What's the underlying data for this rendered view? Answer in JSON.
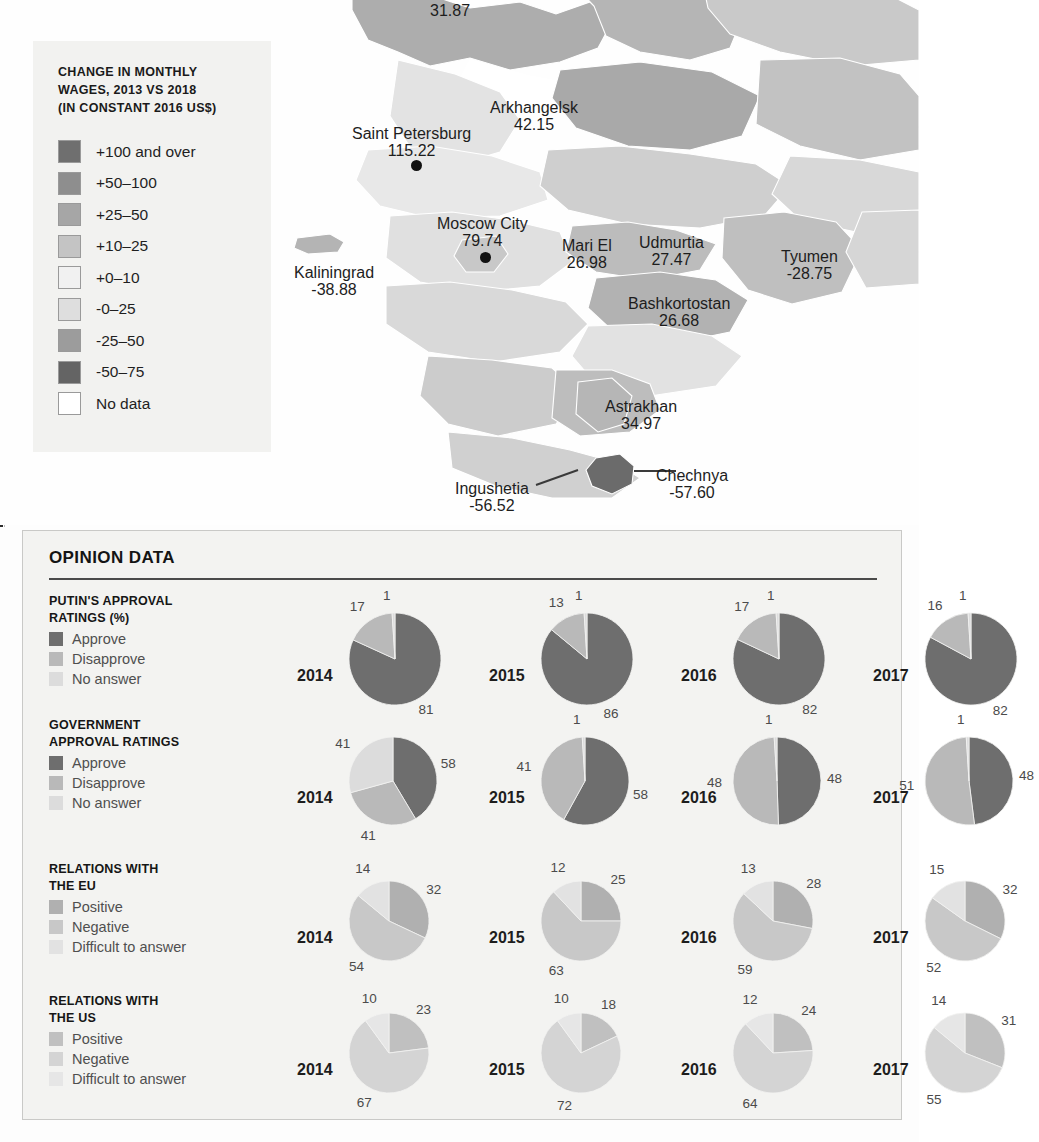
{
  "legend": {
    "title": "CHANGE IN MONTHLY WAGES, 2013 VS 2018 (IN CONSTANT 2016 US$)",
    "title_lines": [
      "CHANGE IN MONTHLY",
      "WAGES, 2013 VS 2018",
      "(IN CONSTANT 2016 US$)"
    ],
    "items": [
      {
        "label": "+100 and over",
        "color": "#6f6f6f"
      },
      {
        "label": "+50–100",
        "color": "#8e8e8e"
      },
      {
        "label": "+25–50",
        "color": "#a6a6a6"
      },
      {
        "label": "+10–25",
        "color": "#c4c4c4"
      },
      {
        "label": "+0–10",
        "color": "#f1f1f1"
      },
      {
        "label": "-0–25",
        "color": "#dedede"
      },
      {
        "label": "-25–50",
        "color": "#9c9c9c"
      },
      {
        "label": "-50–75",
        "color": "#646464"
      },
      {
        "label": "No data",
        "color": "#ffffff"
      }
    ]
  },
  "map": {
    "labels": [
      {
        "name": "",
        "value": "31.87",
        "x": 430,
        "y": 2,
        "dot": false
      },
      {
        "name": "Arkhangelsk",
        "value": "42.15",
        "x": 490,
        "y": 99,
        "dot": false
      },
      {
        "name": "Saint Petersburg",
        "value": "115.22",
        "x": 352,
        "y": 125,
        "dot": true,
        "dot_x": 411,
        "dot_y": 160
      },
      {
        "name": "Moscow City",
        "value": "79.74",
        "x": 437,
        "y": 215,
        "dot": true,
        "dot_x": 480,
        "dot_y": 252
      },
      {
        "name": "Kaliningrad",
        "value": "-38.88",
        "x": 294,
        "y": 264,
        "dot": false
      },
      {
        "name": "Mari El",
        "value": "26.98",
        "x": 562,
        "y": 237,
        "dot": false
      },
      {
        "name": "Udmurtia",
        "value": "27.47",
        "x": 639,
        "y": 234,
        "dot": false
      },
      {
        "name": "Tyumen",
        "value": "-28.75",
        "x": 781,
        "y": 248,
        "dot": false
      },
      {
        "name": "Bashkortostan",
        "value": "26.68",
        "x": 628,
        "y": 295,
        "dot": false
      },
      {
        "name": "Astrakhan",
        "value": "34.97",
        "x": 605,
        "y": 398,
        "dot": false
      },
      {
        "name": "Chechnya",
        "value": "-57.60",
        "x": 656,
        "y": 467,
        "dot": false
      },
      {
        "name": "Ingushetia",
        "value": "-56.52",
        "x": 455,
        "y": 480,
        "dot": false
      }
    ]
  },
  "opinion": {
    "title": "OPINION DATA",
    "years": [
      "2014",
      "2015",
      "2016",
      "2017"
    ]
  },
  "chart_data": [
    {
      "type": "pie",
      "title": "PUTIN'S APPROVAL RATINGS  (%)",
      "title_lines": [
        "PUTIN'S APPROVAL",
        "RATINGS  (%)"
      ],
      "legend_position": "left",
      "legend": [
        {
          "name": "Approve",
          "color": "#6e6e6e"
        },
        {
          "name": "Disapprove",
          "color": "#b9b9b9"
        },
        {
          "name": "No answer",
          "color": "#dcdcdc"
        }
      ],
      "categories": [
        "2014",
        "2015",
        "2016",
        "2017"
      ],
      "series": [
        {
          "name": "Approve",
          "values": [
            81,
            86,
            82,
            82
          ]
        },
        {
          "name": "Disapprove",
          "values": [
            17,
            13,
            17,
            16
          ]
        },
        {
          "name": "No answer",
          "values": [
            1,
            1,
            1,
            1
          ]
        }
      ]
    },
    {
      "type": "pie",
      "title": "GOVERNMENT APPROVAL RATINGS",
      "title_lines": [
        "GOVERNMENT",
        "APPROVAL RATINGS"
      ],
      "legend_position": "left",
      "legend": [
        {
          "name": "Approve",
          "color": "#6e6e6e"
        },
        {
          "name": "Disapprove",
          "color": "#b9b9b9"
        },
        {
          "name": "No answer",
          "color": "#dcdcdc"
        }
      ],
      "categories": [
        "2014",
        "2015",
        "2016",
        "2017"
      ],
      "series": [
        {
          "name": "Approve",
          "values": [
            58,
            58,
            48,
            48
          ]
        },
        {
          "name": "Disapprove",
          "values": [
            41,
            41,
            48,
            51
          ]
        },
        {
          "name": "No answer",
          "values": [
            41,
            1,
            1,
            1
          ]
        }
      ]
    },
    {
      "type": "pie",
      "title": "RELATIONS WITH THE EU",
      "title_lines": [
        "RELATIONS WITH",
        "THE EU"
      ],
      "legend_position": "left",
      "legend": [
        {
          "name": "Positive",
          "color": "#b0b0b0"
        },
        {
          "name": "Negative",
          "color": "#c8c8c8"
        },
        {
          "name": "Difficult to answer",
          "color": "#e2e2e2"
        }
      ],
      "categories": [
        "2014",
        "2015",
        "2016",
        "2017"
      ],
      "series": [
        {
          "name": "Positive",
          "values": [
            32,
            25,
            28,
            32
          ]
        },
        {
          "name": "Negative",
          "values": [
            54,
            63,
            59,
            52
          ]
        },
        {
          "name": "Difficult to answer",
          "values": [
            14,
            12,
            13,
            15
          ]
        }
      ]
    },
    {
      "type": "pie",
      "title": "RELATIONS WITH THE US",
      "title_lines": [
        "RELATIONS WITH",
        "THE US"
      ],
      "legend_position": "left",
      "legend": [
        {
          "name": "Positive",
          "color": "#c0c0c0"
        },
        {
          "name": "Negative",
          "color": "#d4d4d4"
        },
        {
          "name": "Difficult to answer",
          "color": "#e6e6e6"
        }
      ],
      "categories": [
        "2014",
        "2015",
        "2016",
        "2017"
      ],
      "series": [
        {
          "name": "Positive",
          "values": [
            23,
            18,
            24,
            31
          ]
        },
        {
          "name": "Negative",
          "values": [
            67,
            72,
            64,
            55
          ]
        },
        {
          "name": "Difficult to answer",
          "values": [
            10,
            10,
            12,
            14
          ]
        }
      ]
    }
  ]
}
